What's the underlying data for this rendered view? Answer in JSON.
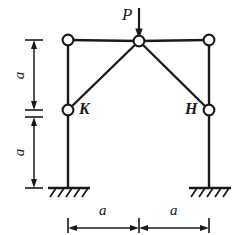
{
  "diagram": {
    "type": "structural-frame",
    "load": {
      "label": "P",
      "direction": "down",
      "applied_at": "apex-node"
    },
    "nodes": [
      {
        "id": "top-left",
        "label": "",
        "x": 68,
        "y": 40
      },
      {
        "id": "apex",
        "label": "",
        "x": 139,
        "y": 41
      },
      {
        "id": "top-right",
        "label": "",
        "x": 209,
        "y": 40
      },
      {
        "id": "K",
        "label": "K",
        "x": 68,
        "y": 110
      },
      {
        "id": "H",
        "label": "H",
        "x": 209,
        "y": 110
      }
    ],
    "node_labels": {
      "left_brace": "K",
      "right_brace": "H"
    },
    "supports": [
      {
        "id": "left-support",
        "kind": "fixed",
        "x": 68,
        "y": 188
      },
      {
        "id": "right-support",
        "kind": "fixed",
        "x": 209,
        "y": 188
      }
    ],
    "dimensions": {
      "vertical": [
        {
          "label": "a",
          "span": "top-left to K"
        },
        {
          "label": "a",
          "span": "K to base"
        }
      ],
      "horizontal": [
        {
          "label": "a",
          "span": "left column to centerline"
        },
        {
          "label": "a",
          "span": "centerline to right column"
        }
      ]
    },
    "colors": {
      "line": "#1a1a1a",
      "joint_fill": "#ffffff",
      "background": "#ffffff"
    }
  }
}
